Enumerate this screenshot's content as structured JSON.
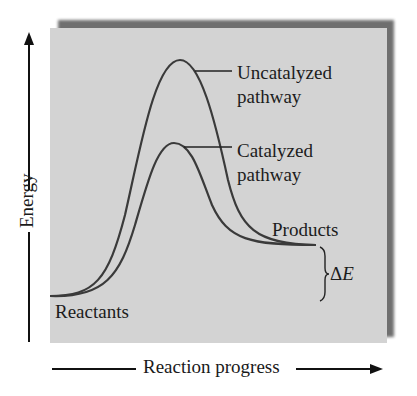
{
  "diagram": {
    "type": "energy-profile",
    "axes": {
      "y_label": "Energy",
      "x_label": "Reaction progress"
    },
    "curves": [
      {
        "name": "Uncatalyzed pathway",
        "line1": "Uncatalyzed",
        "line2": "pathway"
      },
      {
        "name": "Catalyzed pathway",
        "line1": "Catalyzed",
        "line2": "pathway"
      }
    ],
    "labels": {
      "reactants": "Reactants",
      "products": "Products",
      "delta_symbol": "Δ",
      "delta_var": "E"
    },
    "colors": {
      "panel": "#d3d3d3",
      "shadow": "#6f6f6f",
      "curve": "#3a3a3a",
      "text": "#1c1c1c"
    }
  }
}
